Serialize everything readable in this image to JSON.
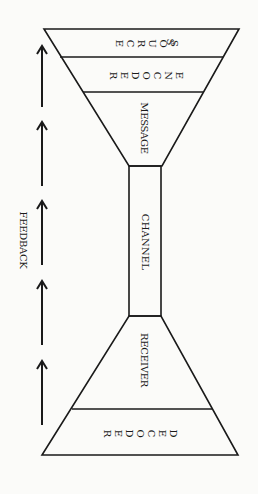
{
  "diagram": {
    "type": "communication-model-hourglass",
    "orientation": "rotated-90-clockwise",
    "stages": [
      {
        "id": "source",
        "label": "SOURCE",
        "letters": [
          "S",
          "O",
          "U",
          "R",
          "C",
          "E"
        ]
      },
      {
        "id": "encoder",
        "label": "ENCODER",
        "letters": [
          "E",
          "N",
          "C",
          "O",
          "D",
          "E",
          "R"
        ]
      },
      {
        "id": "message",
        "label": "MESSAGE"
      },
      {
        "id": "channel",
        "label": "CHANNEL"
      },
      {
        "id": "receiver",
        "label": "RECEIVER"
      },
      {
        "id": "decoder",
        "label": "DECODER",
        "letters": [
          "D",
          "E",
          "C",
          "O",
          "D",
          "E",
          "R"
        ]
      }
    ],
    "feedback": {
      "label": "FEEDBACK",
      "arrow_count": 5,
      "direction": "up"
    },
    "colors": {
      "ink": "#1a1a1a",
      "paper": "#fbfbf9"
    }
  }
}
